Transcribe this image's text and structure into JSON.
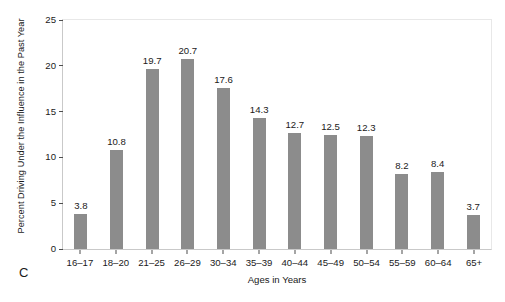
{
  "panel": {
    "label": "C"
  },
  "chart_data": {
    "type": "bar",
    "title": "",
    "subtitle": "",
    "xlabel": "Ages in Years",
    "ylabel": "Percent Driving Under the Influence in the Past Year",
    "categories": [
      "16–17",
      "18–20",
      "21–25",
      "26–29",
      "30–34",
      "35–39",
      "40–44",
      "45–49",
      "50–54",
      "55–59",
      "60–64",
      "65+"
    ],
    "values": [
      3.8,
      10.8,
      19.7,
      20.7,
      17.6,
      14.3,
      12.7,
      12.5,
      12.3,
      8.2,
      8.4,
      3.7
    ],
    "data_labels": [
      "3.8",
      "10.8",
      "19.7",
      "20.7",
      "17.6",
      "14.3",
      "12.7",
      "12.5",
      "12.3",
      "8.2",
      "8.4",
      "3.7"
    ],
    "ylim": [
      0,
      25
    ],
    "yticks": [
      0,
      5,
      10,
      15,
      20,
      25
    ],
    "ytick_labels": [
      "0",
      "5",
      "10",
      "15",
      "20",
      "25"
    ],
    "grid": false,
    "legend": null,
    "bar_color": "#8c8c8c",
    "background_color": "#ffffff",
    "axis_color": "#c9c9c9",
    "text_color": "#1a1a1a"
  }
}
